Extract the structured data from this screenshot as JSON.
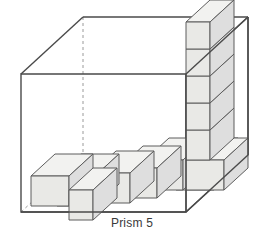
{
  "figure": {
    "caption": "Prism 5",
    "title": "Prism 5",
    "colors": {
      "outline": "#4a4a4a",
      "hidden_edge": "#8d8d8d",
      "cube_stroke": "#5d5d5d",
      "cube_top": "#f2f2f0",
      "cube_front": "#e9e9e6",
      "cube_side": "#dedede",
      "background": "#ffffff",
      "label_text": "#3a3a3a"
    },
    "prism": {
      "name": "outer-prism",
      "front_face": {
        "top_left": [
          21,
          74
        ],
        "top_right": [
          186,
          74
        ],
        "bottom_right": [
          186,
          212
        ],
        "bottom_left": [
          21,
          212
        ]
      },
      "back_offset": [
        62,
        -57
      ],
      "hidden_edges": [
        "back-left-vertical",
        "back-bottom-left-diagonal"
      ]
    },
    "cubes": {
      "unit_top_w": 38,
      "unit_face_w": 38,
      "unit_h": 30,
      "depth_dx": 24,
      "depth_dy": -22,
      "floor_row_count": 6,
      "tower_count": 6,
      "floor_row_label": "staircase row of unit cubes along the base",
      "tower_label": "vertical stack of unit cubes at right rear"
    }
  }
}
